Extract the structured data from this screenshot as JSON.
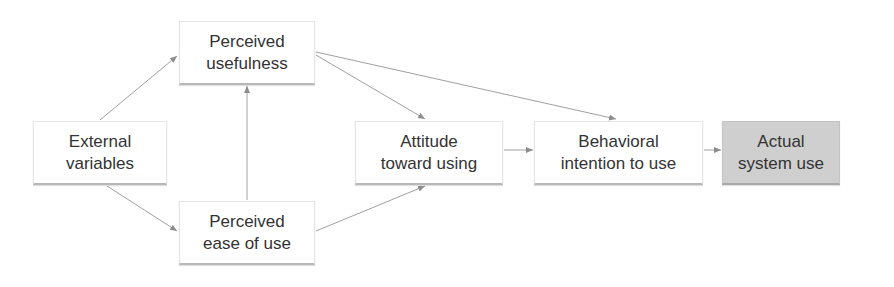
{
  "diagram": {
    "title": "",
    "nodes": [
      {
        "id": "ext",
        "line1": "External",
        "line2": "variables"
      },
      {
        "id": "pu",
        "line1": "Perceived",
        "line2": "usefulness"
      },
      {
        "id": "peou",
        "line1": "Perceived",
        "line2": "ease of use"
      },
      {
        "id": "att",
        "line1": "Attitude",
        "line2": "toward using"
      },
      {
        "id": "bi",
        "line1": "Behavioral",
        "line2": "intention to use"
      },
      {
        "id": "use",
        "line1": "Actual",
        "line2": "system use"
      }
    ],
    "edges": [
      {
        "from": "ext",
        "to": "pu"
      },
      {
        "from": "ext",
        "to": "peou"
      },
      {
        "from": "peou",
        "to": "pu"
      },
      {
        "from": "pu",
        "to": "att"
      },
      {
        "from": "pu",
        "to": "bi"
      },
      {
        "from": "peou",
        "to": "att"
      },
      {
        "from": "att",
        "to": "bi"
      },
      {
        "from": "bi",
        "to": "use"
      }
    ],
    "colors": {
      "edge": "#9a9a9a",
      "box_fill": "#ffffff",
      "highlight_fill": "#cfcfcf"
    }
  }
}
